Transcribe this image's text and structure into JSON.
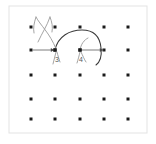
{
  "figure": {
    "background_color": "#ffffff",
    "frame_color": "#e3e3e3",
    "strand_color": "#3a3a3a",
    "strand_light_color": "#9a9a9a",
    "dot_color": "#1a1a1a",
    "label_color": "#5a5a5a",
    "arrow_color": "#6e6e6e"
  },
  "frame": {
    "x": 9,
    "y": 6,
    "width": 138,
    "height": 127
  },
  "grid": {
    "rows": 5,
    "columns": 5,
    "x_positions": [
      31,
      55,
      80,
      104,
      128
    ],
    "y_positions": [
      27,
      50,
      75,
      99,
      119
    ],
    "dot_radius": 1.5
  },
  "labels": [
    {
      "text": "3",
      "x": 57,
      "y": 62
    },
    {
      "text": "4",
      "x": 81,
      "y": 62
    }
  ],
  "crossings": [
    {
      "id": "3",
      "x": 55,
      "y": 50
    },
    {
      "id": "4",
      "x": 80,
      "y": 50
    }
  ],
  "arrows": [
    {
      "name": "arrow-into-node-3",
      "x1": 33,
      "y1": 50,
      "x2": 54,
      "y2": 50,
      "direction": "right"
    },
    {
      "name": "arrow-from-node-4",
      "x1": 81,
      "y1": 50,
      "x2": 103,
      "y2": 50,
      "direction": "right"
    }
  ],
  "strands": [
    {
      "name": "arc-over-3-to-4",
      "d": "M 55 50 C 58 36 70 30 82 30 C 94 30 100 37 101 48 C 102 57 100 62 96 65"
    },
    {
      "name": "x-crossing-left-upper",
      "d": "M 36 17 C 40 25 50 33 56 49"
    },
    {
      "name": "x-crossing-right-upper",
      "d": "M 50 17 C 47 26 42 33 38 42"
    },
    {
      "name": "x-crossing-left-lower-tail",
      "d": "M 36 17 C 34 23 33 28 34 33"
    },
    {
      "name": "x-crossing-right-lower-tail",
      "d": "M 50 17 C 52 22 53 27 52 32"
    },
    {
      "name": "tail-below-3",
      "d": "M 56 52 C 55 56 54 60 53 64"
    },
    {
      "name": "tail-below-3-right",
      "d": "M 57 52 C 58 56 59 59 60 62"
    },
    {
      "name": "up-stub-node-4",
      "d": "M 80 50 C 81 44 84 40 88 38"
    },
    {
      "name": "tail-below-4",
      "d": "M 80 52 C 79 56 78 60 77 63"
    },
    {
      "name": "tail-below-4-right",
      "d": "M 81 52 C 83 56 84 59 86 62"
    }
  ]
}
